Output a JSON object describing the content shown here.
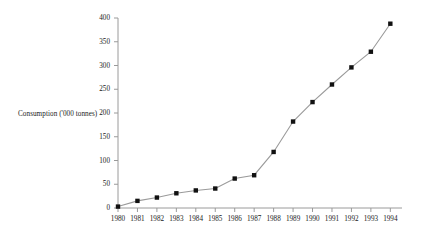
{
  "chart_data": {
    "type": "line",
    "title": "",
    "subtitle": "",
    "xlabel": "",
    "ylabel": "Consumption ('000 tonnes)",
    "categories": [
      "1980",
      "1981",
      "1982",
      "1983",
      "1984",
      "1985",
      "1986",
      "1987",
      "1988",
      "1989",
      "1990",
      "1991",
      "1992",
      "1993",
      "1994"
    ],
    "x": [
      1980,
      1981,
      1982,
      1983,
      1984,
      1985,
      1986,
      1987,
      1988,
      1989,
      1990,
      1991,
      1992,
      1993,
      1994
    ],
    "values": [
      3,
      15,
      22,
      31,
      37,
      41,
      62,
      69,
      118,
      182,
      223,
      260,
      296,
      329,
      388
    ],
    "series": [
      {
        "name": "Consumption",
        "values": [
          3,
          15,
          22,
          31,
          37,
          41,
          62,
          69,
          118,
          182,
          223,
          260,
          296,
          329,
          388
        ]
      }
    ],
    "ylim": [
      0,
      400
    ],
    "yticks": [
      0,
      50,
      100,
      150,
      200,
      250,
      300,
      350,
      400
    ],
    "ytick_labels": [
      "0",
      "50",
      "100",
      "150",
      "200",
      "250",
      "300",
      "350",
      "400"
    ],
    "xtick_labels": [
      "1980",
      "1981",
      "1982",
      "1983",
      "1984",
      "1985",
      "1986",
      "1987",
      "1988",
      "1989",
      "1990",
      "1991",
      "1992",
      "1993",
      "1994"
    ],
    "grid": false,
    "legend": null,
    "legend_position": "none",
    "marker": "square",
    "marker_color": "#111111",
    "line_color": "#9a9a9a",
    "axis_color": "#9a9a9a",
    "annotations": []
  },
  "axis": {
    "y_label_text": "Consumption ('000 tonnes)"
  }
}
